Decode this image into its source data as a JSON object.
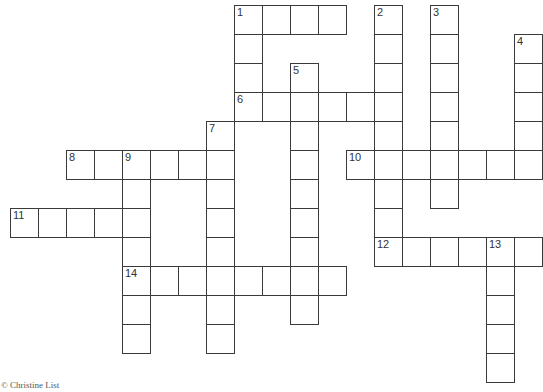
{
  "puzzle": {
    "grid": {
      "origin_x": 10,
      "origin_y": 5,
      "cell_w": 28,
      "cell_h": 29
    },
    "words": [
      {
        "num": 1,
        "dir": "across",
        "row": 0,
        "col": 8,
        "len": 4
      },
      {
        "num": 1,
        "dir": "down",
        "row": 0,
        "col": 8,
        "len": 4
      },
      {
        "num": 2,
        "dir": "down",
        "row": 0,
        "col": 13,
        "len": 9
      },
      {
        "num": 3,
        "dir": "down",
        "row": 0,
        "col": 15,
        "len": 7
      },
      {
        "num": 4,
        "dir": "down",
        "row": 1,
        "col": 18,
        "len": 5
      },
      {
        "num": 5,
        "dir": "down",
        "row": 2,
        "col": 10,
        "len": 9
      },
      {
        "num": 6,
        "dir": "across",
        "row": 3,
        "col": 8,
        "len": 6
      },
      {
        "num": 7,
        "dir": "down",
        "row": 4,
        "col": 7,
        "len": 8
      },
      {
        "num": 8,
        "dir": "across",
        "row": 5,
        "col": 2,
        "len": 6
      },
      {
        "num": 9,
        "dir": "down",
        "row": 5,
        "col": 4,
        "len": 7
      },
      {
        "num": 10,
        "dir": "across",
        "row": 5,
        "col": 12,
        "len": 7
      },
      {
        "num": 11,
        "dir": "across",
        "row": 7,
        "col": 0,
        "len": 5
      },
      {
        "num": 12,
        "dir": "across",
        "row": 8,
        "col": 13,
        "len": 6
      },
      {
        "num": 13,
        "dir": "down",
        "row": 8,
        "col": 17,
        "len": 5
      },
      {
        "num": 14,
        "dir": "across",
        "row": 9,
        "col": 4,
        "len": 8
      }
    ]
  },
  "credit": "© Christine List"
}
